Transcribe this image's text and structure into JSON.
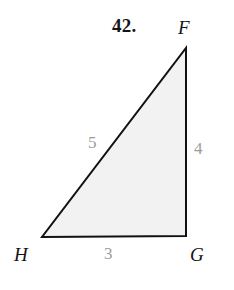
{
  "page": {
    "background_color": "#ffffff",
    "width": 234,
    "height": 290
  },
  "problem": {
    "number_label": "42."
  },
  "figure": {
    "shape_name": "right triangle FGH",
    "fill_color": "#f2f2f2",
    "stroke_color": "#111111",
    "stroke_width": 2,
    "vertices": [
      {
        "name": "F",
        "label": "F",
        "x": 186,
        "y": 48
      },
      {
        "name": "G",
        "label": "G",
        "x": 186,
        "y": 236
      },
      {
        "name": "H",
        "label": "H",
        "x": 42,
        "y": 237
      }
    ],
    "vertex_label_positions": [
      {
        "name": "F",
        "left": 178,
        "top": 18
      },
      {
        "name": "G",
        "left": 190,
        "top": 245
      },
      {
        "name": "H",
        "left": 14,
        "top": 245
      }
    ],
    "sides": [
      {
        "name": "HF",
        "label": "5",
        "label_color": "#9b9b9b",
        "left": 88,
        "top": 134
      },
      {
        "name": "FG",
        "label": "4",
        "label_color": "#9b9b9b",
        "left": 194,
        "top": 140
      },
      {
        "name": "HG",
        "label": "3",
        "label_color": "#9b9b9b",
        "left": 104,
        "top": 245
      }
    ]
  }
}
